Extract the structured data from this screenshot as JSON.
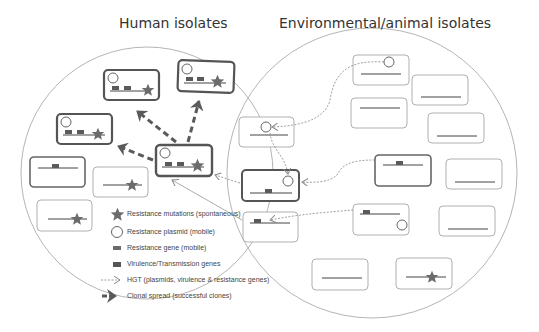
{
  "titles": {
    "left": "Human isolates",
    "right": "Environmental/animal isolates"
  },
  "colors": {
    "circle_stroke": "#b5b5b5",
    "box_bold_stroke": "#555555",
    "box_light_stroke": "#b0b0b0",
    "gene_fill": "#5a5a5a",
    "star_fill": "#6b6b6b",
    "text": "#444444"
  },
  "legend": {
    "items": [
      {
        "icon": "star-icon",
        "label": "Resistance mutations (spontaneous)"
      },
      {
        "icon": "circle-icon",
        "label": "Resistance plasmid (mobile)"
      },
      {
        "icon": "small-rect-icon",
        "label": "Resistance gene (mobile)"
      },
      {
        "icon": "dark-rect-icon",
        "label": "Virulence/Transmission genes"
      },
      {
        "icon": "dotted-arrow-icon",
        "label": "HGT (plasmids, virulence & resistance genes)"
      },
      {
        "icon": "bold-dashed-arrow-icon",
        "label": "Clonal spread (successful clones)"
      }
    ]
  },
  "boxes": {
    "human": [
      {
        "id": "h-top-center",
        "features": [
          "plasmid",
          "resistance-gene",
          "virulence-gene",
          "mutation"
        ],
        "bold": true
      },
      {
        "id": "h-top-right",
        "features": [
          "plasmid",
          "resistance-gene",
          "virulence-gene",
          "mutation"
        ],
        "bold": true
      },
      {
        "id": "h-mid-left",
        "features": [
          "plasmid",
          "resistance-gene",
          "virulence-gene",
          "mutation"
        ],
        "bold": true
      },
      {
        "id": "h-hub",
        "features": [
          "plasmid",
          "resistance-gene",
          "virulence-gene",
          "mutation"
        ],
        "bold": true
      },
      {
        "id": "h-left-gene",
        "features": [
          "virulence-gene"
        ],
        "bold": true
      },
      {
        "id": "h-mid-star",
        "features": [
          "mutation"
        ],
        "bold": false
      },
      {
        "id": "h-low-star",
        "features": [
          "mutation"
        ],
        "bold": false
      }
    ],
    "overlap": [
      {
        "id": "o-top",
        "features": [
          "plasmid"
        ],
        "bold": false
      },
      {
        "id": "o-mid",
        "features": [
          "plasmid",
          "virulence-gene"
        ],
        "bold": true
      },
      {
        "id": "o-low",
        "features": [
          "resistance-gene"
        ],
        "bold": false
      }
    ],
    "environment": [
      {
        "id": "e-1",
        "features": [
          "plasmid"
        ],
        "bold": false
      },
      {
        "id": "e-2",
        "features": [],
        "bold": false
      },
      {
        "id": "e-3",
        "features": [],
        "bold": false
      },
      {
        "id": "e-4",
        "features": [],
        "bold": false
      },
      {
        "id": "e-5",
        "features": [
          "virulence-gene"
        ],
        "bold": true
      },
      {
        "id": "e-6",
        "features": [],
        "bold": false
      },
      {
        "id": "e-7",
        "features": [
          "resistance-gene",
          "plasmid"
        ],
        "bold": false
      },
      {
        "id": "e-8",
        "features": [],
        "bold": false
      },
      {
        "id": "e-9",
        "features": [],
        "bold": false
      },
      {
        "id": "e-10",
        "features": [
          "mutation"
        ],
        "bold": false
      }
    ]
  }
}
